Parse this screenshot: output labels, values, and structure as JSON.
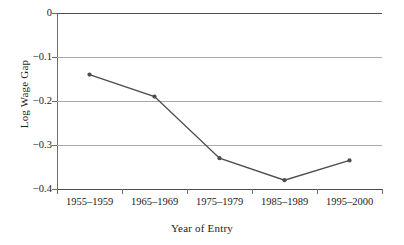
{
  "chart_data": {
    "type": "line",
    "title": "",
    "subtitle": "",
    "xlabel": "Year of Entry",
    "ylabel": "Log Wage Gap",
    "categories": [
      "1955–1959",
      "1965–1969",
      "1975–1979",
      "1985–1989",
      "1995–2000"
    ],
    "values": [
      -0.14,
      -0.19,
      -0.33,
      -0.38,
      -0.335
    ],
    "series": [
      {
        "name": "Log Wage Gap",
        "values": [
          -0.14,
          -0.19,
          -0.33,
          -0.38,
          -0.335
        ]
      }
    ],
    "ylim": [
      -0.4,
      0
    ],
    "yticks": [
      "0",
      "−0.1",
      "−0.2",
      "−0.3",
      "−0.4"
    ],
    "ytick_values": [
      0,
      -0.1,
      -0.2,
      -0.3,
      -0.4
    ],
    "grid": "horizontal",
    "legend": "none",
    "line_color": "#4d4d4d",
    "marker_color": "#4d4d4d",
    "grid_color": "#a9a9a9",
    "axis_color": "#6e6e6e",
    "background": "#ffffff"
  },
  "axes": {
    "y_title": "Log Wage Gap",
    "x_title": "Year of Entry"
  }
}
